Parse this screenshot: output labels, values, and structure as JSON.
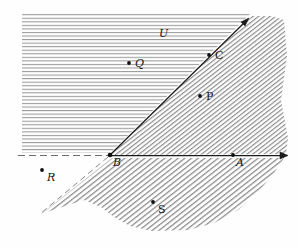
{
  "figure": {
    "width": 298,
    "height": 248,
    "background_color": "#fefefe",
    "ink_color": "#141414",
    "hatch_color": "#8d8d8d"
  },
  "regions": [
    {
      "name": "upper-left-region",
      "label": "U",
      "hatch_style": "horizontal",
      "description": "Horizontally hatched half-plane above the horizontal line through B and left of the ray from B through C"
    },
    {
      "name": "right-cone-region",
      "label": "",
      "hatch_style": "diagonal-up-right",
      "description": "Diagonally hatched cone to the right of the ray from B through C and above the horizontal ray from B through A"
    },
    {
      "name": "lower-cone-region",
      "label": "",
      "hatch_style": "diagonal-up-right",
      "description": "Diagonally hatched cone below the horizontal line through B and right of the dashed ray descending to the lower left of B"
    }
  ],
  "lines": [
    {
      "name": "ray-b-to-c",
      "style": "solid",
      "arrow": "end",
      "from": "B",
      "through": "C",
      "description": "Solid ray from B rising to the upper right with an arrowhead"
    },
    {
      "name": "ray-b-to-a",
      "style": "solid",
      "arrow": "end",
      "from": "B",
      "through": "A",
      "description": "Solid horizontal ray from B to the right with an arrowhead"
    },
    {
      "name": "dashed-line-left-of-b",
      "style": "dashed",
      "arrow": "none",
      "from": "B",
      "description": "Dashed horizontal extension to the left of B"
    },
    {
      "name": "dashed-ray-lower-left",
      "style": "dashed",
      "arrow": "none",
      "from": "B",
      "description": "Dashed ray descending from B to the lower left"
    }
  ],
  "points": [
    {
      "name": "point-u",
      "label": "U",
      "dot": false,
      "label_x": 159,
      "label_y": 28,
      "italic": true
    },
    {
      "name": "point-q",
      "label": "Q",
      "dot": true,
      "x": 129,
      "y": 63,
      "label_x": 135,
      "label_y": 59,
      "italic": true
    },
    {
      "name": "point-c",
      "label": "C",
      "dot": true,
      "x": 209,
      "y": 55,
      "label_x": 215,
      "label_y": 51,
      "italic": false
    },
    {
      "name": "point-p",
      "label": "P",
      "dot": true,
      "x": 200,
      "y": 96,
      "label_x": 206,
      "label_y": 92,
      "italic": false
    },
    {
      "name": "point-b",
      "label": "B",
      "dot": true,
      "x": 110,
      "y": 155,
      "label_x": 113,
      "label_y": 158,
      "italic": true
    },
    {
      "name": "point-a",
      "label": "A",
      "dot": true,
      "x": 233,
      "y": 155,
      "label_x": 236,
      "label_y": 158,
      "italic": true
    },
    {
      "name": "point-r",
      "label": "R",
      "dot": true,
      "x": 42,
      "y": 170,
      "label_x": 47,
      "label_y": 173,
      "italic": true
    },
    {
      "name": "point-s",
      "label": "S",
      "dot": true,
      "x": 153,
      "y": 202,
      "label_x": 158,
      "label_y": 205,
      "italic": false
    }
  ]
}
